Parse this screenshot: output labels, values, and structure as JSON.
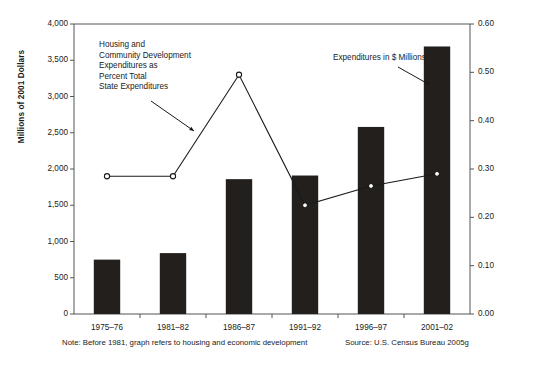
{
  "chart_data": {
    "type": "bar",
    "title": "",
    "subtitle": "",
    "categories": [
      "1975–76",
      "1981–82",
      "1986–87",
      "1991–92",
      "1996–97",
      "2001–02"
    ],
    "xlabel": "",
    "series": [
      {
        "name": "Expenditures in $ Millions",
        "type": "bar",
        "axis": "left",
        "values": [
          750,
          840,
          1860,
          1910,
          2580,
          3690
        ],
        "color": "#231f1c"
      },
      {
        "name": "Housing and Community Development Expenditures as Percent Total State Expenditures",
        "type": "line",
        "axis": "right",
        "values": [
          0.285,
          0.285,
          0.495,
          0.225,
          0.265,
          0.29
        ],
        "color": "#1a1a1a",
        "marker": "circle-open"
      }
    ],
    "left_axis": {
      "label": "Millions of 2001 Dollars",
      "ylim": [
        0,
        4000
      ],
      "ticks": [
        0,
        500,
        1000,
        1500,
        2000,
        2500,
        3000,
        3500,
        4000
      ],
      "tick_labels": [
        "0",
        "500",
        "1,000",
        "1,500",
        "2,000",
        "2,500",
        "3,000",
        "3,500",
        "4,000"
      ]
    },
    "right_axis": {
      "label": "Percent of Total State Expenditures",
      "ylim": [
        0,
        0.6
      ],
      "ticks": [
        0.0,
        0.1,
        0.2,
        0.3,
        0.4,
        0.5,
        0.6
      ],
      "tick_labels": [
        "0.00",
        "0.10",
        "0.20",
        "0.30",
        "0.40",
        "0.50",
        "0.60"
      ]
    },
    "grid": false,
    "legend": "annotations"
  },
  "annotations": {
    "line_callout": {
      "lines": [
        "Housing and",
        "Community Development",
        "Expenditures as",
        "Percent Total",
        "State Expenditures"
      ]
    },
    "bar_callout": {
      "text": "Expenditures in $ Millions"
    }
  },
  "footnotes": {
    "note": "Note: Before 1981, graph refers to housing and economic development",
    "source": "Source: U.S. Census Bureau 2005g"
  }
}
